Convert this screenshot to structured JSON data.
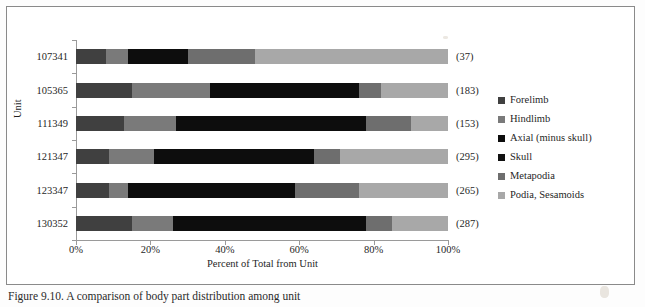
{
  "figure": {
    "caption": "Figure 9.10. A comparison of body part distribution among unit"
  },
  "chart_data": {
    "type": "bar",
    "subtype": "horizontal-stacked-100-percent",
    "title": "",
    "xlabel": "Percent of Total from Unit",
    "ylabel": "Unit",
    "xlim": [
      0,
      100
    ],
    "xticks": [
      "0%",
      "20%",
      "40%",
      "60%",
      "80%",
      "100%"
    ],
    "xtick_values": [
      0,
      20,
      40,
      60,
      80,
      100
    ],
    "grid": false,
    "legend_position": "right",
    "categories": [
      "107341",
      "105365",
      "111349",
      "121347",
      "123347",
      "130352"
    ],
    "counts": [
      "(37)",
      "(183)",
      "(153)",
      "(295)",
      "(265)",
      "(287)"
    ],
    "series": [
      {
        "name": "Forelimb",
        "color": "#404040",
        "values": [
          8,
          15,
          13,
          9,
          9,
          15
        ]
      },
      {
        "name": "Hindlimb",
        "color": "#7a7a7a",
        "values": [
          6,
          21,
          14,
          12,
          5,
          11
        ]
      },
      {
        "name": "Axial (minus skull)",
        "color": "#0d0d0d",
        "values": [
          16,
          40,
          51,
          43,
          45,
          52
        ]
      },
      {
        "name": "Skull",
        "color": "#111111",
        "values": [
          0,
          0,
          0,
          0,
          0,
          0
        ]
      },
      {
        "name": "Metapodia",
        "color": "#6e6e6e",
        "values": [
          18,
          6,
          12,
          7,
          17,
          7
        ]
      },
      {
        "name": "Podia, Sesamoids",
        "color": "#a8a8a8",
        "values": [
          52,
          18,
          10,
          29,
          24,
          15
        ]
      }
    ]
  }
}
